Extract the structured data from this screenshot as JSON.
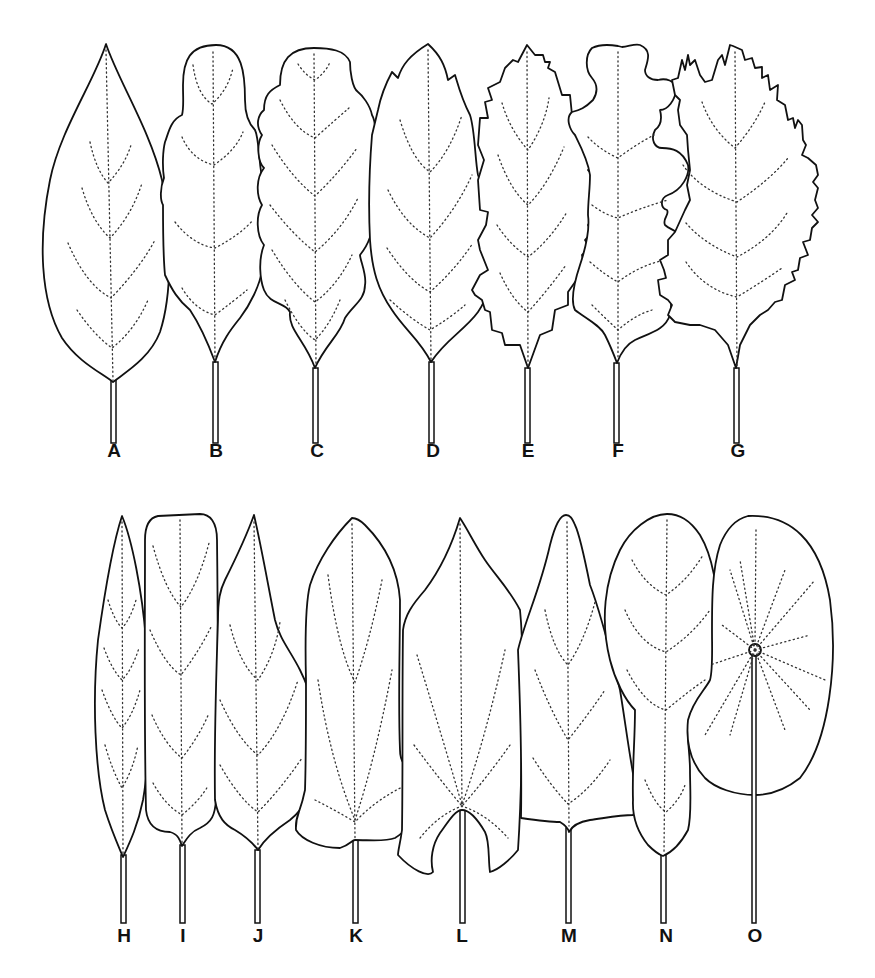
{
  "figure": {
    "type": "leaf-shape-diagram",
    "rows": [
      {
        "row": 1,
        "leaves": [
          {
            "id": "A",
            "label": "A",
            "label_x": 114,
            "label_y": 452
          },
          {
            "id": "B",
            "label": "B",
            "label_x": 216,
            "label_y": 452
          },
          {
            "id": "C",
            "label": "C",
            "label_x": 317,
            "label_y": 452
          },
          {
            "id": "D",
            "label": "D",
            "label_x": 433,
            "label_y": 452
          },
          {
            "id": "E",
            "label": "E",
            "label_x": 528,
            "label_y": 452
          },
          {
            "id": "F",
            "label": "F",
            "label_x": 618,
            "label_y": 452
          },
          {
            "id": "G",
            "label": "G",
            "label_x": 738,
            "label_y": 452
          }
        ]
      },
      {
        "row": 2,
        "leaves": [
          {
            "id": "H",
            "label": "H",
            "label_x": 124,
            "label_y": 937
          },
          {
            "id": "I",
            "label": "I",
            "label_x": 183,
            "label_y": 937
          },
          {
            "id": "J",
            "label": "J",
            "label_x": 258,
            "label_y": 937
          },
          {
            "id": "K",
            "label": "K",
            "label_x": 356,
            "label_y": 937
          },
          {
            "id": "L",
            "label": "L",
            "label_x": 462,
            "label_y": 937
          },
          {
            "id": "M",
            "label": "M",
            "label_x": 569,
            "label_y": 937
          },
          {
            "id": "N",
            "label": "N",
            "label_x": 666,
            "label_y": 937
          },
          {
            "id": "O",
            "label": "O",
            "label_x": 755,
            "label_y": 937
          }
        ]
      }
    ],
    "colors": {
      "outline": "#111111",
      "background": "#ffffff",
      "vein": "#333333"
    }
  }
}
